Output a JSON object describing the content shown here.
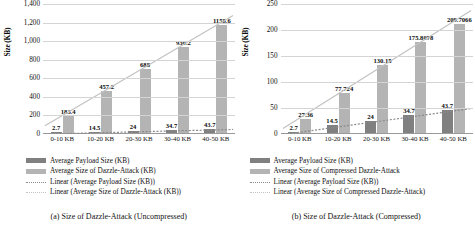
{
  "figure": {
    "panels": [
      {
        "caption": "(a) Size of Dazzle-Attack (Uncompressed)",
        "legend": [
          {
            "label": "Average Payload Size (KB)",
            "marker": "bar-dark"
          },
          {
            "label": "Average Size of Dazzle-Attack (KB)",
            "marker": "bar-light"
          },
          {
            "label": "Linear (Average Payload Size (KB))",
            "marker": "dotted-dark"
          },
          {
            "label": "Linear (Average Size of Dazzle-Attack (KB))",
            "marker": "dotted-light"
          }
        ]
      },
      {
        "caption": "(b) Size of Dazzle-Attack (Compressed)",
        "legend": [
          {
            "label": "Average Payload Size (KB)",
            "marker": "bar-dark"
          },
          {
            "label": "Average Size of Compressed Dazzle-Attack",
            "marker": "bar-light"
          },
          {
            "label": "Linear (Average Payload Size (KB))",
            "marker": "dotted-dark"
          },
          {
            "label": "Linear (Average Size of Compressed Dazzle-Attack)",
            "marker": "dotted-light"
          }
        ]
      }
    ]
  },
  "colors": {
    "payload_bar": "#808080",
    "dazzle_bar": "#b4b4b4",
    "gridline": "#d4d4d4",
    "axis": "#9a9a9a",
    "text": "#0d0d0d"
  },
  "chart_data": [
    {
      "type": "bar",
      "title": "(a) Size of Dazzle-Attack (Uncompressed)",
      "xlabel": "",
      "ylabel": "Size (KB)",
      "categories": [
        "0-10 KB",
        "10-20 KB",
        "20-30 KB",
        "30-40 KB",
        "40-50 KB"
      ],
      "ylim": [
        0,
        1400
      ],
      "yticks": [
        "0",
        "200",
        "400",
        "600",
        "800",
        "1,000",
        "1,200",
        "1,400"
      ],
      "ytick_values": [
        0,
        200,
        400,
        600,
        800,
        1000,
        1200,
        1400
      ],
      "grid": true,
      "legend_position": "below",
      "series": [
        {
          "name": "Average Payload Size (KB)",
          "color": "#808080",
          "values": [
            2.7,
            14.5,
            24,
            34.7,
            43.7
          ],
          "labels": [
            "2.7",
            "14.5",
            "24",
            "34.7",
            "43.7"
          ]
        },
        {
          "name": "Average Size of Dazzle-Attack (KB)",
          "color": "#b4b4b4",
          "values": [
            183.4,
            457.2,
            688,
            930.2,
            1158.6
          ],
          "labels": [
            "183.4",
            "457.2",
            "688",
            "930.2",
            "1158.6"
          ]
        }
      ],
      "trendlines": [
        {
          "name": "Linear (Average Payload Size (KB))",
          "style": "dotted",
          "color": "#8a8a8a"
        },
        {
          "name": "Linear (Average Size of Dazzle-Attack (KB))",
          "style": "dotted",
          "color": "#c2c2c2"
        }
      ]
    },
    {
      "type": "bar",
      "title": "(b) Size of Dazzle-Attack (Compressed)",
      "xlabel": "",
      "ylabel": "Size (KB)",
      "categories": [
        "0-10 KB",
        "10-20 KB",
        "20-30 KB",
        "30-40 KB",
        "40-50 KB"
      ],
      "ylim": [
        0,
        250
      ],
      "yticks": [
        "0",
        "50",
        "100",
        "150",
        "200",
        "250"
      ],
      "ytick_values": [
        0,
        50,
        100,
        150,
        200,
        250
      ],
      "grid": true,
      "legend_position": "below",
      "series": [
        {
          "name": "Average Payload Size (KB)",
          "color": "#808080",
          "values": [
            2.7,
            14.5,
            24,
            34.7,
            43.7
          ],
          "labels": [
            "2.7",
            "14.5",
            "24",
            "34.7",
            "43.7"
          ]
        },
        {
          "name": "Average Size of Compressed Dazzle-Attack",
          "color": "#b4b4b4",
          "values": [
            27.36,
            77.724,
            130.15,
            175.8078,
            209.7066
          ],
          "labels": [
            "27.36",
            "77.724",
            "130.15",
            "175.8078",
            "209.7066"
          ]
        }
      ],
      "trendlines": [
        {
          "name": "Linear (Average Payload Size (KB))",
          "style": "dotted",
          "color": "#8a8a8a"
        },
        {
          "name": "Linear (Average Size of Compressed Dazzle-Attack)",
          "style": "dotted",
          "color": "#c2c2c2"
        }
      ]
    }
  ]
}
